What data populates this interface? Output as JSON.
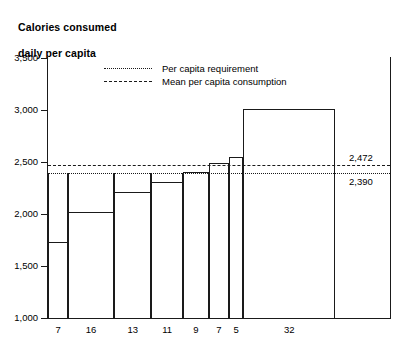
{
  "chart_data": {
    "type": "bar",
    "title": "Calories consumed\ndaily per capita",
    "title_line1": "Calories consumed",
    "title_line2": "daily per capita",
    "xlabel": "",
    "ylabel": "",
    "ylim": [
      1000,
      3500
    ],
    "grid": false,
    "legend_position": "top-center",
    "categories": [
      "7",
      "16",
      "13",
      "11",
      "9",
      "7",
      "5",
      "32"
    ],
    "category_widths_percent": [
      7,
      16,
      13,
      11,
      9,
      7,
      5,
      32
    ],
    "values": [
      1730,
      2020,
      2215,
      2310,
      2405,
      2490,
      2545,
      3010
    ],
    "series": [
      {
        "name": "Calories consumed daily per capita",
        "values": [
          1730,
          2020,
          2215,
          2310,
          2405,
          2490,
          2545,
          3010
        ]
      }
    ],
    "yticks": [
      1000,
      1500,
      2000,
      2500,
      3000,
      3500
    ],
    "ytick_labels": [
      "1,000",
      "1,500",
      "2,000",
      "2,500",
      "3,000",
      "3,500"
    ],
    "reference_lines": [
      {
        "name": "per-capita-requirement",
        "label": "Per capita requirement",
        "value": 2390,
        "value_label": "2,390",
        "style": "dotted"
      },
      {
        "name": "mean-per-capita-consumption",
        "label": "Mean per capita consumption",
        "value": 2472,
        "value_label": "2,472",
        "style": "dashed"
      }
    ],
    "legend": [
      {
        "label": "Per capita requirement",
        "style": "dotted"
      },
      {
        "label": "Mean per capita consumption",
        "style": "dashed"
      }
    ],
    "annotations": [
      {
        "name": "calorie-deficit-shading",
        "description": "Stippled area between bar tops and the per capita requirement line for groups below requirement",
        "applies_to": [
          "7",
          "16",
          "13",
          "11"
        ]
      }
    ],
    "colors": {
      "line": "#1a1a1a",
      "bar_fill": "#ffffff",
      "stipple": "#555555",
      "background": "#ffffff"
    }
  }
}
